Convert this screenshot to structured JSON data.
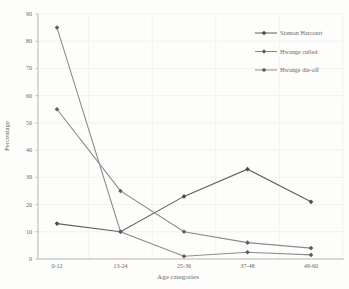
{
  "chart_data": {
    "type": "line",
    "title": "",
    "xlabel": "Age categories",
    "ylabel": "Percentage",
    "categories": [
      "0-12",
      "13-24",
      "25-36",
      "37-48",
      "49-60"
    ],
    "series": [
      {
        "name": "Stanton Harcourt",
        "values": [
          13,
          10,
          23,
          33,
          21
        ],
        "color": "#5f5f5f",
        "marker_color": "#4c4c4c"
      },
      {
        "name": "Hwange culled",
        "values": [
          55,
          25,
          10,
          6,
          4
        ],
        "color": "#8a8a8a",
        "marker_color": "#5e5e5e"
      },
      {
        "name": "Hwange die-off",
        "values": [
          85,
          10,
          1,
          2.5,
          1.5
        ],
        "color": "#8f8f8f",
        "marker_color": "#5e5e5e"
      }
    ],
    "ylim": [
      0,
      90
    ],
    "ytick_step": 10,
    "grid": true,
    "legend_position": "top-right",
    "marker": "diamond"
  },
  "colors": {
    "background": "#fdfdfc",
    "axis": "#b3aea7",
    "gridline": "#f2eeeb",
    "text": "#6b6860"
  }
}
